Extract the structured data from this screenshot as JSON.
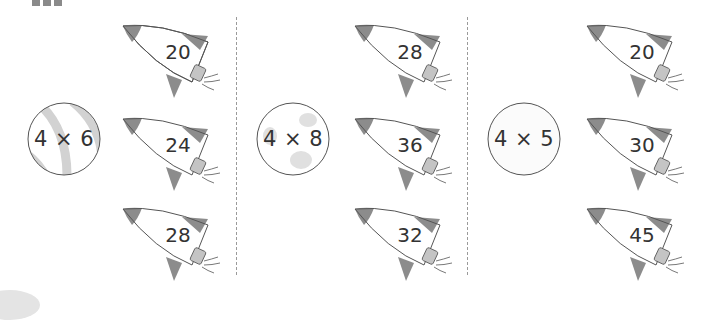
{
  "colors": {
    "fin": "#8c8c8c",
    "nozzle": "#c4c4c4",
    "outline": "#555555",
    "divider": "#9a9a9a",
    "planet_stripe": "#d2d2d2"
  },
  "groups": [
    {
      "planet": {
        "expression": "4 × 6",
        "style": "striped"
      },
      "rockets": [
        {
          "answer": "20"
        },
        {
          "answer": "24"
        },
        {
          "answer": "28"
        }
      ]
    },
    {
      "planet": {
        "expression": "4 × 8",
        "style": "cratered"
      },
      "rockets": [
        {
          "answer": "28"
        },
        {
          "answer": "36"
        },
        {
          "answer": "32"
        }
      ]
    },
    {
      "planet": {
        "expression": "4 × 5",
        "style": "plain"
      },
      "rockets": [
        {
          "answer": "20"
        },
        {
          "answer": "30"
        },
        {
          "answer": "45"
        }
      ]
    }
  ]
}
